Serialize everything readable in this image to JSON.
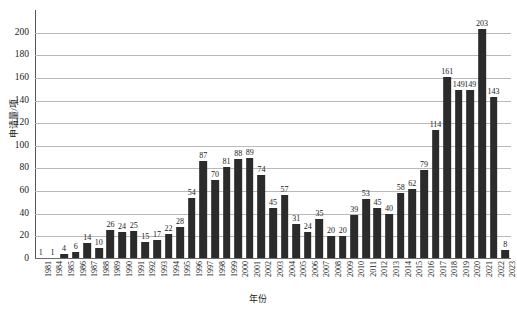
{
  "chart_data": {
    "type": "bar",
    "title": "",
    "xlabel": "年份",
    "ylabel": "申请量/项",
    "ylim": [
      0,
      220
    ],
    "yticks": [
      0,
      20,
      40,
      60,
      80,
      100,
      120,
      140,
      160,
      180,
      200
    ],
    "grid": true,
    "legend": "none",
    "bar_color": "#2b2b2b",
    "grid_color": "#b9b9b9",
    "axis_color": "#555555",
    "background": "#ffffff",
    "show_value_labels": true,
    "categories": [
      "1981",
      "1984",
      "1985",
      "1986",
      "1987",
      "1988",
      "1989",
      "1990",
      "1991",
      "1992",
      "1993",
      "1994",
      "1995",
      "1996",
      "1997",
      "1998",
      "1999",
      "2000",
      "2001",
      "2002",
      "2003",
      "2004",
      "2005",
      "2006",
      "2007",
      "2008",
      "2009",
      "2010",
      "2011",
      "2012",
      "2013",
      "2014",
      "2015",
      "2016",
      "2017",
      "2018",
      "2019",
      "2020",
      "2021",
      "2022",
      "2023"
    ],
    "values": [
      1,
      1,
      4,
      6,
      14,
      10,
      26,
      24,
      25,
      15,
      17,
      22,
      28,
      54,
      87,
      70,
      81,
      88,
      89,
      74,
      45,
      57,
      31,
      24,
      35,
      20,
      20,
      39,
      53,
      45,
      40,
      58,
      62,
      79,
      114,
      161,
      149,
      149,
      203,
      143,
      8
    ]
  }
}
